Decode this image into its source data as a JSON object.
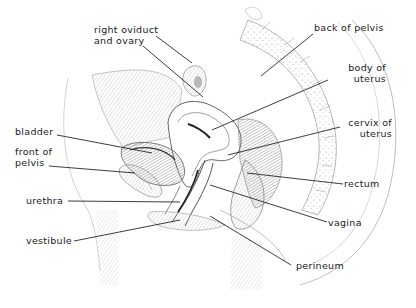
{
  "diagram": {
    "style": "pencil illustration",
    "labels": [
      {
        "id": "right-oviduct-and-ovary",
        "line1": "right oviduct",
        "line2": "and ovary"
      },
      {
        "id": "back-of-pelvis",
        "line1": "back of pelvis",
        "line2": ""
      },
      {
        "id": "body-of-uterus",
        "line1": "body of",
        "line2": "uterus"
      },
      {
        "id": "bladder",
        "line1": "bladder",
        "line2": ""
      },
      {
        "id": "cervix-of-uterus",
        "line1": "cervix of",
        "line2": "uterus"
      },
      {
        "id": "front-of-pelvis",
        "line1": "front of",
        "line2": "pelvis"
      },
      {
        "id": "rectum",
        "line1": "rectum",
        "line2": ""
      },
      {
        "id": "urethra",
        "line1": "urethra",
        "line2": ""
      },
      {
        "id": "vagina",
        "line1": "vagina",
        "line2": ""
      },
      {
        "id": "vestibule",
        "line1": "vestibule",
        "line2": ""
      },
      {
        "id": "perineum",
        "line1": "perineum",
        "line2": ""
      }
    ]
  }
}
